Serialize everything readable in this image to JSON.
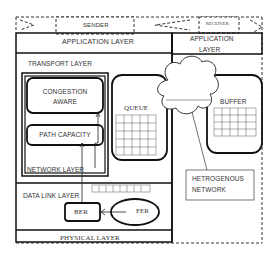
{
  "sender": {
    "label": "SENDER"
  },
  "receiver": {
    "label": "RECEIVER"
  },
  "sender_stack": {
    "application_layer": "APPLICATION LAYER",
    "transport_layer": "TRANSPORT LAYER",
    "congestion_aware_line1": "CONGESTION",
    "congestion_aware_line2": "AWARE",
    "path_capacity": "PATH CAPACITY",
    "queue": "QUEUE",
    "network_layer": "NETWORK LAYER",
    "data_link_layer": "DATA LINK LAYER",
    "ber": "BER",
    "fer": "FER",
    "physical_layer": "PHYSICAL LAYER"
  },
  "receiver_stack": {
    "application_layer_line1": "APPLICATION",
    "application_layer_line2": "LAYER",
    "buffer": "BUFFER"
  },
  "network": {
    "label_line1": "HETROGENOUS",
    "label_line2": "NETWORK"
  }
}
